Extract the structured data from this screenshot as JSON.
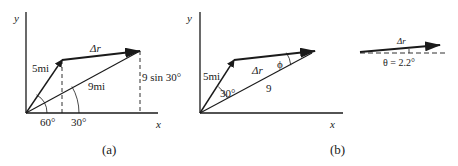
{
  "panel_a": {
    "caption": "(a)",
    "axis_y": "y",
    "axis_x": "x",
    "vector_5": "5mi",
    "vector_9": "9mi",
    "delta_r": "Δr⃗",
    "vertical_label": "9 sin 30°",
    "angle_60": "60°",
    "angle_30": "30°"
  },
  "panel_b": {
    "caption": "(b)",
    "axis_y": "y",
    "axis_x": "x",
    "vector_5": "5mi",
    "vector_9": "9",
    "delta_r": "Δr⃗",
    "angle_30": "30°",
    "angle_phi": "ϕ"
  },
  "panel_c": {
    "delta_r": "Δr⃗",
    "theta_label": "θ = 2.2°"
  },
  "colors": {
    "ink": "#1a1a1a"
  }
}
